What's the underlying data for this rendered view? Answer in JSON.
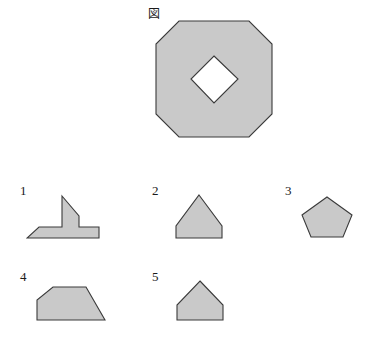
{
  "figure": {
    "caption": "図",
    "caption_x": 148,
    "caption_y": 8
  },
  "style": {
    "background": "#ffffff",
    "shape_fill": "#c9c9c9",
    "shape_stroke": "#3a3a3a",
    "text_color": "#1a1a1a"
  },
  "main_shape": {
    "name": "octagon-with-diamond-hole",
    "x": 155,
    "y": 20,
    "width": 118,
    "height": 118,
    "outer_points": "24,1 94,1 117,24 117,94 94,117 24,117 1,94 1,24",
    "hole_points": "59,36 83,59 59,83 36,59",
    "description": "Large octagon with a square diamond-shaped hole in the middle"
  },
  "options": [
    {
      "number": "1",
      "name": "shape-option-1",
      "label_x": 20,
      "label_y": 184,
      "svg_x": 26,
      "svg_y": 194,
      "svg_w": 76,
      "svg_h": 46,
      "points": "36,2 53,22 53,33 73,33 73,44 1,44 13,33 36,33 36,22",
      "description": "Peaked tower on a wide stepped trapezoid base"
    },
    {
      "number": "2",
      "name": "shape-option-2",
      "label_x": 152,
      "label_y": 184,
      "svg_x": 172,
      "svg_y": 194,
      "svg_w": 54,
      "svg_h": 46,
      "points": "27,1 50,32 50,44 4,44 4,32",
      "description": "Pentagon with tall peaked apex"
    },
    {
      "number": "3",
      "name": "shape-option-3",
      "label_x": 285,
      "label_y": 184,
      "svg_x": 300,
      "svg_y": 196,
      "svg_w": 54,
      "svg_h": 42,
      "points": "27,1 52,19 43,41 11,41 2,19",
      "description": "Regular pentagon"
    },
    {
      "number": "4",
      "name": "shape-option-4",
      "label_x": 20,
      "label_y": 270,
      "svg_x": 36,
      "svg_y": 286,
      "svg_w": 70,
      "svg_h": 36,
      "points": "17,1 50,1 69,34 1,34 1,14",
      "description": "Trapezoid with vertical left edge and long diagonal right edge"
    },
    {
      "number": "5",
      "name": "shape-option-5",
      "label_x": 152,
      "label_y": 270,
      "svg_x": 174,
      "svg_y": 280,
      "svg_w": 52,
      "svg_h": 42,
      "points": "26,1 49,25 49,40 3,40 3,25",
      "description": "House-shaped pentagon with peaked roof"
    }
  ]
}
